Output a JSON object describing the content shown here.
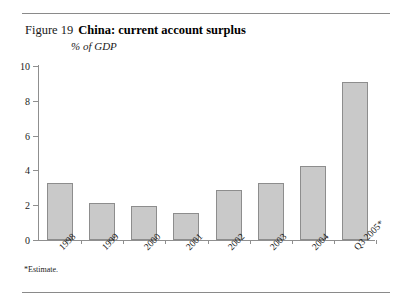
{
  "figure": {
    "number_label": "Figure 19",
    "title": "China: current account surplus",
    "subtitle": "% of GDP",
    "footnote": "*Estimate."
  },
  "style": {
    "bar_fill": "#c9c9c9",
    "bar_border": "#8d8d8d",
    "axis_color": "#8f8f8f",
    "rule_color": "#8a8a8a",
    "text_color": "#1a1a1a"
  },
  "chart_data": {
    "type": "bar",
    "title": "China: current account surplus",
    "subtitle": "% of GDP",
    "xlabel": "",
    "ylabel": "",
    "ylim": [
      0,
      10
    ],
    "yticks": [
      0,
      2,
      4,
      6,
      8,
      10
    ],
    "ytick_labels": [
      "0",
      "2",
      "4",
      "6",
      "8",
      "10"
    ],
    "grid": false,
    "legend": false,
    "categories": [
      "1998",
      "1999",
      "2000",
      "2001",
      "2002",
      "2003",
      "2004",
      "Q3 2005*"
    ],
    "values": [
      3.3,
      2.15,
      1.95,
      1.55,
      2.85,
      3.3,
      4.25,
      9.1
    ],
    "annotations": [
      "*Estimate."
    ]
  }
}
